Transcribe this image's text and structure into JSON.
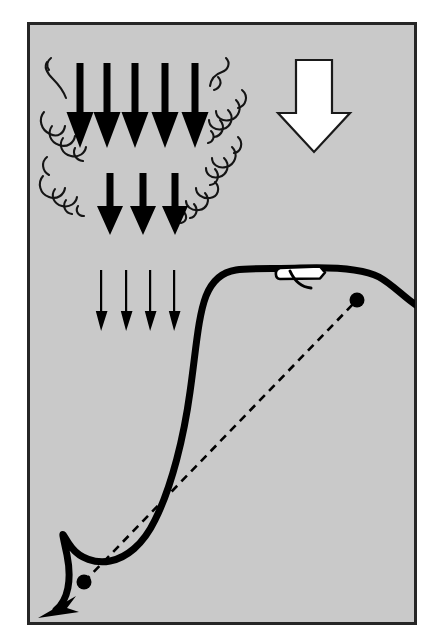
{
  "figure": {
    "title": "Microburst wind shear encounter diagram",
    "kind": "technical-illustration",
    "canvas": {
      "width": 435,
      "height": 640
    },
    "background_color": "#ffffff",
    "panel": {
      "label": "illustration-panel",
      "fill_color": "#c9c9c9",
      "border_color": "#262626",
      "border_width": 3,
      "x": 27,
      "y": 22,
      "width": 390,
      "height": 603
    },
    "ink_color": "#000000",
    "highlight_color": "#ffffff"
  },
  "downdraft": {
    "label": "downdraft-arrows",
    "description": "Columns of downward arrows representing descending air in a microburst",
    "rows": [
      {
        "name": "downdraft-row-top",
        "style": "thick",
        "count": 5,
        "y_top": 63,
        "y_tip": 148,
        "shaft_width": 7,
        "head_width": 20,
        "head_height": 36,
        "x_positions": [
          80,
          107,
          135,
          165,
          195
        ]
      },
      {
        "name": "downdraft-row-middle",
        "style": "thick",
        "count": 3,
        "y_top": 173,
        "y_tip": 235,
        "shaft_width": 7,
        "head_width": 19,
        "head_height": 33,
        "x_positions": [
          110,
          143,
          175
        ]
      },
      {
        "name": "downdraft-row-bottom",
        "style": "thin",
        "count": 4,
        "y_top": 270,
        "y_tip": 331,
        "shaft_width": 2,
        "head_width": 11,
        "head_height": 20,
        "x_positions": [
          101,
          126,
          150,
          174
        ]
      }
    ]
  },
  "turbulence": {
    "label": "turbulence-curls",
    "description": "Curled wisp strokes flanking the downdraft columns, indicating outflow turbulence",
    "stroke_width": 2,
    "clusters": [
      {
        "name": "curl-cluster-upper-left",
        "x": 45,
        "y": 60
      },
      {
        "name": "curl-cluster-lower-left",
        "x": 42,
        "y": 108
      },
      {
        "name": "curl-cluster-upper-right",
        "x": 208,
        "y": 58
      },
      {
        "name": "curl-cluster-mid-right",
        "x": 218,
        "y": 95
      },
      {
        "name": "curl-cluster-left-mid",
        "x": 45,
        "y": 155
      },
      {
        "name": "curl-cluster-left-low",
        "x": 58,
        "y": 185
      },
      {
        "name": "curl-cluster-right-low",
        "x": 206,
        "y": 140
      },
      {
        "name": "curl-cluster-right-bottom",
        "x": 190,
        "y": 185
      }
    ]
  },
  "wind_arrow": {
    "label": "primary-wind-arrow",
    "description": "Large hollow outlined arrow indicating overall direction of the descending air mass",
    "direction": "down",
    "fill_color": "#ffffff",
    "outline_color": "#1a1a1a",
    "outline_width": 2,
    "shaft_x": 296,
    "shaft_width": 36,
    "y_top": 60,
    "head_y": 113,
    "head_half_width": 36,
    "y_tip": 152,
    "center_x": 314
  },
  "aircraft": {
    "label": "aircraft-symbol",
    "description": "Side-view aircraft silhouette flying along the solid flight path",
    "fill_color": "#ffffff",
    "outline_color": "#000000",
    "x": 277,
    "y": 268,
    "body_length": 50,
    "body_height": 12,
    "wing_stroke_width": 3
  },
  "flight_path": {
    "label": "actual-flight-path",
    "description": "Solid heavy curve: the aircraft's actual trajectory through the microburst, ending in a terminating arrowhead at lower left",
    "style": "solid",
    "stroke_width": 7,
    "stroke_color": "#000000",
    "end_arrow": {
      "name": "flight-path-arrowhead",
      "x": 48,
      "y": 608,
      "direction": "down-left"
    }
  },
  "glide_path": {
    "label": "intended-glide-path",
    "description": "Dashed straight line: the intended approach / glide slope between the two marker points",
    "style": "dashed",
    "stroke_width": 2.5,
    "stroke_color": "#000000",
    "dash_pattern": "8 6"
  },
  "markers": [
    {
      "name": "marker-point-lower-left",
      "description": "Black dot marking the lower end of the intended glide path",
      "x": 84,
      "y": 582,
      "radius": 7,
      "color": "#000000"
    },
    {
      "name": "marker-point-upper-right",
      "description": "Black dot marking the upper end of the intended glide path",
      "x": 357,
      "y": 300,
      "radius": 7,
      "color": "#000000"
    }
  ]
}
